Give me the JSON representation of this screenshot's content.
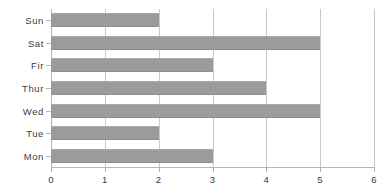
{
  "chart_data": {
    "type": "bar",
    "orientation": "horizontal",
    "title": "",
    "subtitle": "",
    "xlabel": "",
    "ylabel": "",
    "categories": [
      "Sun",
      "Sat",
      "Fir",
      "Thur",
      "Wed",
      "Tue",
      "Mon"
    ],
    "values": [
      2,
      5,
      3,
      4,
      5,
      2,
      3
    ],
    "series": [
      {
        "name": "",
        "values": [
          2,
          5,
          3,
          4,
          5,
          2,
          3
        ]
      }
    ],
    "xlim": [
      0,
      6
    ],
    "xticks": [
      0,
      1,
      2,
      3,
      4,
      5,
      6
    ],
    "xtick_labels": [
      "0",
      "1",
      "2",
      "3",
      "4",
      "5",
      "6"
    ],
    "grid": true,
    "grid_axis": "x",
    "legend": false,
    "legend_position": "none",
    "colors": {
      "bar": "#9b9b9b",
      "grid": "#c9c9c9",
      "axis": "#b6b6b6",
      "text": "#3b3b3b",
      "background": "#ffffff"
    }
  }
}
